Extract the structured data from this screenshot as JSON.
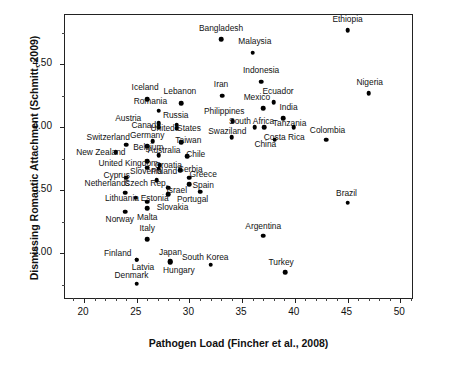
{
  "chart_data": {
    "type": "scatter",
    "title": "",
    "xlabel": "Pathogen Load (Fincher et al., 2008)",
    "ylabel": "Dismissing Romantic Attachment (Schmitt, 2009)",
    "xlim": [
      18.2,
      51.3
    ],
    "ylim": [
      2.63,
      4.89
    ],
    "xticks": [
      20,
      25,
      30,
      35,
      40,
      45,
      50
    ],
    "xtick_labels": [
      "20",
      "25",
      "30",
      "35",
      "40",
      "45",
      "50"
    ],
    "yticks": [
      3.0,
      3.5,
      4.0,
      4.5
    ],
    "ytick_labels": [
      "3.00",
      "3.50",
      "4.00",
      "4.50"
    ],
    "grid": false,
    "legend": "none",
    "marker": "filled-circle",
    "marker_color": "#000000",
    "points": [
      {
        "label": "Ethiopia",
        "x": 45.0,
        "y": 4.77,
        "lx": 45.0,
        "ly": 4.86,
        "lpos": "above"
      },
      {
        "label": "Bangladesh",
        "x": 33.0,
        "y": 4.7,
        "lx": 33.0,
        "ly": 4.79,
        "lpos": "above"
      },
      {
        "label": "Malaysia",
        "x": 36.0,
        "y": 4.59,
        "lx": 36.2,
        "ly": 4.68,
        "lpos": "above"
      },
      {
        "label": "Indonesia",
        "x": 36.8,
        "y": 4.36,
        "lx": 36.8,
        "ly": 4.45,
        "lpos": "above"
      },
      {
        "label": "Nigeria",
        "x": 47.0,
        "y": 4.27,
        "lx": 47.1,
        "ly": 4.36,
        "lpos": "above"
      },
      {
        "label": "Iran",
        "x": 33.1,
        "y": 4.25,
        "lx": 33.0,
        "ly": 4.34,
        "lpos": "above"
      },
      {
        "label": "Iceland",
        "x": 26.0,
        "y": 4.22,
        "lx": 25.8,
        "ly": 4.32,
        "lpos": "above"
      },
      {
        "label": "Ecuador",
        "x": 38.0,
        "y": 4.2,
        "lx": 38.4,
        "ly": 4.29,
        "lpos": "above"
      },
      {
        "label": "Lebanon",
        "x": 29.2,
        "y": 4.19,
        "lx": 29.1,
        "ly": 4.29,
        "lpos": "above"
      },
      {
        "label": "Mexico",
        "x": 37.0,
        "y": 4.15,
        "lx": 36.4,
        "ly": 4.24,
        "lpos": "above"
      },
      {
        "label": "Romania",
        "x": 27.1,
        "y": 4.13,
        "lx": 26.3,
        "ly": 4.21,
        "lpos": "above"
      },
      {
        "label": "India",
        "x": 38.9,
        "y": 4.07,
        "lx": 39.4,
        "ly": 4.16,
        "lpos": "above"
      },
      {
        "label": "Philippines",
        "x": 34.1,
        "y": 4.05,
        "lx": 33.3,
        "ly": 4.13,
        "lpos": "above"
      },
      {
        "label": "Canada",
        "x": 27.1,
        "y": 4.03,
        "lx": 25.9,
        "ly": 4.02,
        "lpos": "left"
      },
      {
        "label": "Russia",
        "x": 28.8,
        "y": 4.02,
        "lx": 28.7,
        "ly": 4.1,
        "lpos": "above"
      },
      {
        "label": "Austria",
        "x": 27.1,
        "y": 4.0,
        "lx": 24.2,
        "ly": 4.07,
        "lpos": "left"
      },
      {
        "label": "South Africa",
        "x": 36.2,
        "y": 4.0,
        "lx": 35.9,
        "ly": 4.05,
        "lpos": "left"
      },
      {
        "label": "Tanzania",
        "x": 37.1,
        "y": 4.0,
        "lx": 39.5,
        "ly": 4.03,
        "lpos": "right"
      },
      {
        "label": "Costa Rica",
        "x": 39.9,
        "y": 4.0,
        "lx": 39.0,
        "ly": 3.92,
        "lpos": "below"
      },
      {
        "label": "United States",
        "x": 28.8,
        "y": 3.99,
        "lx": 28.7,
        "ly": 3.99,
        "lpos": "above"
      },
      {
        "label": "Swaziland",
        "x": 34.0,
        "y": 3.92,
        "lx": 33.6,
        "ly": 3.97,
        "lpos": "above"
      },
      {
        "label": "Colombia",
        "x": 43.0,
        "y": 3.9,
        "lx": 43.1,
        "ly": 3.98,
        "lpos": "above"
      },
      {
        "label": "China",
        "x": 38.1,
        "y": 3.9,
        "lx": 37.2,
        "ly": 3.87,
        "lpos": "below"
      },
      {
        "label": "Germany",
        "x": 26.5,
        "y": 3.89,
        "lx": 26.0,
        "ly": 3.94,
        "lpos": "left"
      },
      {
        "label": "Taiwan",
        "x": 29.2,
        "y": 3.88,
        "lx": 29.9,
        "ly": 3.9,
        "lpos": "right"
      },
      {
        "label": "Switzerland",
        "x": 24.0,
        "y": 3.86,
        "lx": 22.3,
        "ly": 3.92,
        "lpos": "left"
      },
      {
        "label": "Belgium",
        "x": 26.0,
        "y": 3.85,
        "lx": 26.1,
        "ly": 3.84,
        "lpos": "left"
      },
      {
        "label": "New Zealand",
        "x": 23.0,
        "y": 3.8,
        "lx": 21.6,
        "ly": 3.8,
        "lpos": "left"
      },
      {
        "label": "Australia",
        "x": 27.1,
        "y": 3.78,
        "lx": 27.6,
        "ly": 3.82,
        "lpos": "right"
      },
      {
        "label": "Chile",
        "x": 29.8,
        "y": 3.77,
        "lx": 30.6,
        "ly": 3.79,
        "lpos": "right"
      },
      {
        "label": "United Kingdom",
        "x": 26.0,
        "y": 3.73,
        "lx": 24.2,
        "ly": 3.72,
        "lpos": "left"
      },
      {
        "label": "Croatia",
        "x": 27.2,
        "y": 3.7,
        "lx": 28.0,
        "ly": 3.7,
        "lpos": "right"
      },
      {
        "label": "Slovenia",
        "x": 26.0,
        "y": 3.68,
        "lx": 25.9,
        "ly": 3.65,
        "lpos": "left"
      },
      {
        "label": "Poland",
        "x": 27.1,
        "y": 3.67,
        "lx": 27.6,
        "ly": 3.65,
        "lpos": "right"
      },
      {
        "label": "Serbia",
        "x": 29.1,
        "y": 3.66,
        "lx": 30.1,
        "ly": 3.67,
        "lpos": "right"
      },
      {
        "label": "Cyprus",
        "x": 24.0,
        "y": 3.6,
        "lx": 23.1,
        "ly": 3.62,
        "lpos": "left"
      },
      {
        "label": "Greece",
        "x": 30.0,
        "y": 3.6,
        "lx": 31.3,
        "ly": 3.63,
        "lpos": "right"
      },
      {
        "label": "Czech Rep.",
        "x": 26.9,
        "y": 3.58,
        "lx": 25.9,
        "ly": 3.56,
        "lpos": "left"
      },
      {
        "label": "Netherlands",
        "x": 23.9,
        "y": 3.48,
        "lx": 22.2,
        "ly": 3.56,
        "lpos": "left"
      },
      {
        "label": "Israel",
        "x": 28.0,
        "y": 3.52,
        "lx": 28.8,
        "ly": 3.5,
        "lpos": "right"
      },
      {
        "label": "Spain",
        "x": 31.0,
        "y": 3.49,
        "lx": 31.3,
        "ly": 3.54,
        "lpos": "right"
      },
      {
        "label": "Portugal",
        "x": 30.0,
        "y": 3.55,
        "lx": 30.3,
        "ly": 3.43,
        "lpos": "below"
      },
      {
        "label": "Slovakia",
        "x": 28.0,
        "y": 3.47,
        "lx": 28.4,
        "ly": 3.37,
        "lpos": "below"
      },
      {
        "label": "Lithuania",
        "x": 24.9,
        "y": 3.44,
        "lx": 23.6,
        "ly": 3.44,
        "lpos": "left"
      },
      {
        "label": "Estonia",
        "x": 26.0,
        "y": 3.41,
        "lx": 26.7,
        "ly": 3.44,
        "lpos": "right"
      },
      {
        "label": "Brazil",
        "x": 45.0,
        "y": 3.4,
        "lx": 44.9,
        "ly": 3.48,
        "lpos": "above"
      },
      {
        "label": "Malta",
        "x": 26.0,
        "y": 3.36,
        "lx": 26.0,
        "ly": 3.29,
        "lpos": "below"
      },
      {
        "label": "Norway",
        "x": 23.9,
        "y": 3.33,
        "lx": 23.4,
        "ly": 3.27,
        "lpos": "below"
      },
      {
        "label": "Argentina",
        "x": 37.0,
        "y": 3.14,
        "lx": 37.0,
        "ly": 3.22,
        "lpos": "above"
      },
      {
        "label": "Italy",
        "x": 26.0,
        "y": 3.11,
        "lx": 26.0,
        "ly": 3.2,
        "lpos": "above"
      },
      {
        "label": "Latvia",
        "x": 25.0,
        "y": 2.95,
        "lx": 25.6,
        "ly": 2.89,
        "lpos": "below"
      },
      {
        "label": "Finland",
        "x": 25.0,
        "y": 2.95,
        "lx": 23.2,
        "ly": 3.0,
        "lpos": "left"
      },
      {
        "label": "Japan",
        "x": 28.2,
        "y": 2.94,
        "lx": 28.2,
        "ly": 3.01,
        "lpos": "above"
      },
      {
        "label": "Hungary",
        "x": 28.2,
        "y": 2.93,
        "lx": 29.0,
        "ly": 2.87,
        "lpos": "below"
      },
      {
        "label": "South Korea",
        "x": 32.0,
        "y": 2.91,
        "lx": 31.5,
        "ly": 2.97,
        "lpos": "above"
      },
      {
        "label": "Turkey",
        "x": 39.1,
        "y": 2.85,
        "lx": 38.7,
        "ly": 2.93,
        "lpos": "above"
      },
      {
        "label": "Denmark",
        "x": 25.0,
        "y": 2.76,
        "lx": 24.5,
        "ly": 2.83,
        "lpos": "below"
      }
    ]
  }
}
